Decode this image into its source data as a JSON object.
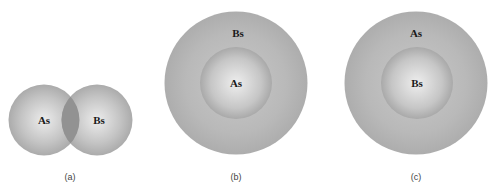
{
  "diagrams": [
    {
      "caption": "(a)",
      "description": "Two overlapping spheres",
      "left_label": "As",
      "right_label": "Bs"
    },
    {
      "caption": "(b)",
      "description": "Core-shell: As core, Bs shell",
      "outer_label": "Bs",
      "inner_label": "As"
    },
    {
      "caption": "(c)",
      "description": "Core-shell: Bs core, As shell",
      "outer_label": "As",
      "inner_label": "Bs"
    }
  ],
  "colors": {
    "sphere_light": "#e8e8e8",
    "sphere_mid": "#b4b4b4",
    "sphere_edge": "#a8a8a8",
    "overlap": "#8e8e8e",
    "text": "#1a1a1a"
  }
}
